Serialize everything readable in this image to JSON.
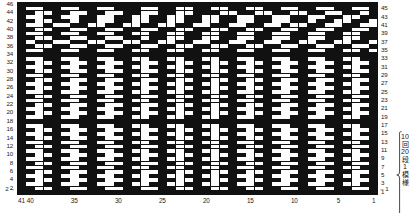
{
  "chart_data": {
    "type": "heatmap",
    "title": "",
    "xlabel": "",
    "ylabel": "",
    "grid": true,
    "legend_position": "none",
    "columns": 41,
    "rows": 46,
    "column_order": "right-to-left",
    "row_order": "bottom-to-top",
    "colors": {
      "filled": "#111111",
      "empty": "#fdfdfd",
      "gridline": "#111111",
      "background": "#ffffff"
    },
    "value_meaning": {
      "1": "filled square (black stitch)",
      "0": "empty square (white stitch)"
    },
    "x_tick_labels": [
      "41",
      "40",
      "35",
      "30",
      "25",
      "20",
      "15",
      "10",
      "5",
      "1"
    ],
    "x_tick_columns": [
      41,
      40,
      35,
      30,
      25,
      20,
      15,
      10,
      5,
      1
    ],
    "y_tick_labels_left": [
      "46",
      "44",
      "42",
      "40",
      "38",
      "36",
      "34",
      "32",
      "30",
      "28",
      "26",
      "24",
      "22",
      "20",
      "18",
      "16",
      "14",
      "12",
      "10",
      "8",
      "6",
      "4",
      "2"
    ],
    "y_tick_labels_right": [
      "45",
      "43",
      "41",
      "39",
      "37",
      "35",
      "33",
      "31",
      "29",
      "27",
      "25",
      "23",
      "21",
      "19",
      "17",
      "15",
      "13",
      "11",
      "9",
      "7",
      "5",
      "3",
      "1"
    ],
    "matrix": [
      "11111111111111111111111111111111111111111",
      "10011001100111001100110011001100110011001",
      "11001100110011001100111001100110011001101",
      "10011001100110011001100110011001100110011",
      "11001101100110011001100110011001101100110",
      "10010011001100110011001100110010011001100",
      "11001100110011001100110011001100110011001",
      "10011001100110011001100110011001100110011",
      "11001100110011011001100110011001100110011",
      "10110011001100110011001100110011001100110",
      "11001100110011001100110011001100110011001",
      "10011001100110011001100110011001100110010",
      "11111111111111111111111111111111111111111",
      "10011001100110011001100110011001100110011",
      "11001100110011001100110011001100110011001",
      "10011001100110011001100110011001100110011",
      "11001100110011001100110011001100110011001",
      "10011001100110011001100110011001100110011",
      "11001100110011001100110011001100110011001",
      "10011001100110011001100110011001100110011",
      "11001100110011001100110011001100110011001",
      "10011001100110011001100110011001100110011",
      "11001100110011001100110011001100110011001",
      "10011001100110011001100110011001100110011",
      "11001100110011001100110011001100110011001",
      "10011001100110011001100110011001100110011",
      "11001100110011001100110011001100110011001",
      "10011001100110011001100110011001100110011",
      "11111111111111111111111111111111111111111",
      "10011001100110011001100110011001100110011",
      "11001100110011001100110011001100110011001",
      "10011001100110011001100110011001100110011",
      "11001100110011001100110011001100110011001",
      "10011001100110011001100110011001100110011",
      "11001100110011001100110011001100110011001",
      "10011001100110011001100110011001100110011",
      "11001100110011001100110011001100110011001",
      "10011001100110011001100110011001100110011",
      "11001100110011001100110011001100110011001",
      "10011001100110011001100110011001100110011",
      "11001100110011001100110011001100110011001",
      "10011001100110011001100110011001100110011",
      "11001100110011001100110011001100110011001",
      "10011001100110011001100110011001100110011",
      "11001100110011001100110011001100110011001",
      "11111111111111111111111111111111111111111"
    ]
  },
  "axis": {
    "left_labels": [
      "46",
      "",
      "44",
      "",
      "42",
      "",
      "40",
      "",
      "38",
      "",
      "36",
      "",
      "34",
      "",
      "32",
      "",
      "30",
      "",
      "28",
      "",
      "26",
      "",
      "24",
      "",
      "22",
      "",
      "20",
      "",
      "18",
      "",
      "16",
      "",
      "14",
      "",
      "12",
      "",
      "10",
      "",
      "8",
      "",
      "6",
      "",
      "4",
      "",
      "2",
      ""
    ],
    "right_labels": [
      "",
      "45",
      "",
      "43",
      "",
      "41",
      "",
      "39",
      "",
      "37",
      "",
      "35",
      "",
      "33",
      "",
      "31",
      "",
      "29",
      "",
      "27",
      "",
      "25",
      "",
      "23",
      "",
      "21",
      "",
      "19",
      "",
      "17",
      "",
      "15",
      "",
      "13",
      "",
      "11",
      "",
      "9",
      "",
      "7",
      "",
      "5",
      "",
      "3",
      "",
      "1"
    ],
    "bottom_ticks": [
      {
        "label": "41",
        "column": 41
      },
      {
        "label": "40",
        "column": 40
      },
      {
        "label": "35",
        "column": 35
      },
      {
        "label": "30",
        "column": 30
      },
      {
        "label": "25",
        "column": 25
      },
      {
        "label": "20",
        "column": 20
      },
      {
        "label": "15",
        "column": 15
      },
      {
        "label": "10",
        "column": 10
      },
      {
        "label": "5",
        "column": 5
      },
      {
        "label": "1",
        "column": 1
      }
    ]
  },
  "annotations": {
    "start_row_left": "2→",
    "start_row_right": "←1",
    "repeat_note_lines": [
      "10",
      "回",
      "20",
      "段",
      "1",
      "模",
      "様"
    ],
    "repeat_note_text": "10回20段1模様",
    "repeat_span_rows": [
      1,
      21
    ]
  }
}
